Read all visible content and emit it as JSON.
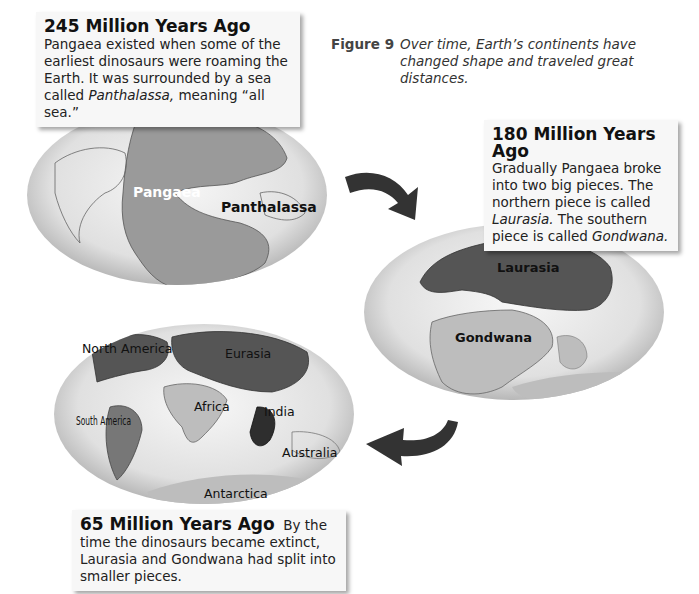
{
  "figure": {
    "number_label": "Figure 9",
    "caption": "Over time, Earth’s continents have changed shape and traveled great distances."
  },
  "stages": [
    {
      "heading": "245 Million Years Ago",
      "text_parts": {
        "p1": "Pangaea existed when some of the earliest dinosaurs were roaming the Earth. It was surrounded by a sea called ",
        "italic": "Panthalassa,",
        "p2": " meaning “all sea.”"
      },
      "map_labels": [
        "Pangaea",
        "Panthalassa"
      ]
    },
    {
      "heading": "180 Million Years Ago",
      "text_parts": {
        "p1": "Gradually Pangaea broke into two big pieces. The northern piece is called ",
        "italic1": "Laurasia.",
        "p2": " The southern piece is called ",
        "italic2": "Gondwana."
      },
      "map_labels": [
        "Laurasia",
        "Gondwana"
      ]
    },
    {
      "heading": "65 Million Years Ago",
      "text": "By the time the dinosaurs became extinct, Laurasia and Gondwana had split into smaller pieces.",
      "map_labels": [
        "North America",
        "Eurasia",
        "South America",
        "Africa",
        "India",
        "Australia",
        "Antarctica"
      ]
    }
  ],
  "colors": {
    "ocean": "#e6e6e6",
    "land_mid": "#9a9a9a",
    "land_dark": "#555555",
    "land_light": "#bdbdbd",
    "arrow": "#333333"
  }
}
